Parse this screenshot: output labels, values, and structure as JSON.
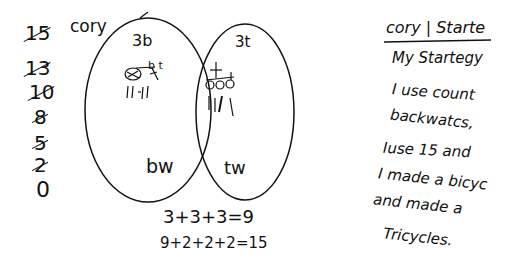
{
  "countdown": {
    "numbers": [
      "15",
      "13",
      "10",
      "8",
      "5",
      "2",
      "0"
    ],
    "crossed_out": [
      true,
      true,
      true,
      true,
      true,
      true,
      false
    ]
  },
  "name_label": "cory",
  "venn": {
    "left": {
      "top_label": "3b",
      "bottom_label": "bw",
      "drawing": "bicycle",
      "tally": "11-11",
      "bike_letters": "b t"
    },
    "right": {
      "top_label": "3t",
      "bottom_label": "tw",
      "drawing": "tricycles",
      "tally": "1111"
    }
  },
  "equations": [
    "3+3+3=9",
    "9+2+2+2=15"
  ],
  "explanation": {
    "header": "cory | Starte",
    "lines": [
      "My Startegy",
      "I use count",
      "backwatcs,",
      "Iuse 15 and",
      "I made a bicyc",
      "and made a",
      "Tricycles."
    ]
  }
}
